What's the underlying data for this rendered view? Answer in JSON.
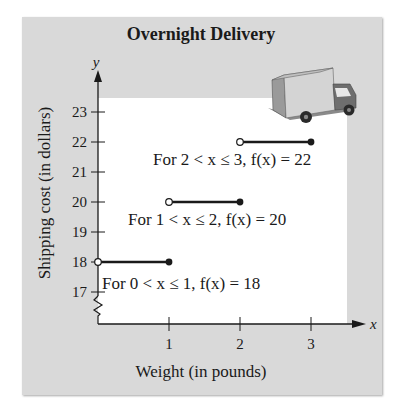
{
  "chart_data": {
    "type": "line",
    "subtype": "step-function",
    "title": "Overnight Delivery",
    "xlabel": "Weight (in pounds)",
    "ylabel": "Shipping cost (in dollars)",
    "x_axis_var": "x",
    "y_axis_var": "y",
    "xlim": [
      0,
      3.5
    ],
    "ylim": [
      17,
      23.5
    ],
    "x_ticks": [
      1,
      2,
      3
    ],
    "y_ticks": [
      17,
      18,
      19,
      20,
      21,
      22,
      23
    ],
    "y_axis_break": true,
    "grid": false,
    "legend": null,
    "series": [
      {
        "name": "f(x)",
        "segments": [
          {
            "x_start": 0,
            "x_end": 1,
            "y": 18,
            "start_open": true,
            "end_closed": true
          },
          {
            "x_start": 1,
            "x_end": 2,
            "y": 20,
            "start_open": true,
            "end_closed": true
          },
          {
            "x_start": 2,
            "x_end": 3,
            "y": 22,
            "start_open": true,
            "end_closed": true
          }
        ]
      }
    ],
    "annotations": [
      "For 0 < x ≤ 1, f(x) = 18",
      "For 1 < x ≤ 2, f(x) = 20",
      "For 2 < x ≤ 3, f(x) = 22"
    ],
    "illustration": "delivery-truck"
  },
  "labels": {
    "title": "Overnight Delivery",
    "xlabel": "Weight (in pounds)",
    "ylabel": "Shipping cost (in dollars)"
  },
  "colors": {
    "panel": "#d9d9d9",
    "plot": "#ffffff",
    "ink": "#1a1a1a"
  }
}
